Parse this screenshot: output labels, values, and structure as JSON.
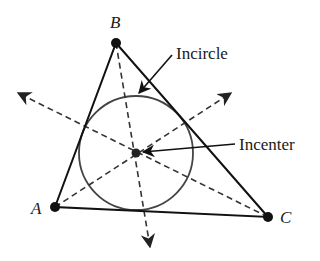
{
  "diagram": {
    "colors": {
      "stroke": "#111111",
      "circle": "#444444",
      "dashed": "#333333",
      "background": "#ffffff"
    },
    "vertices": [
      {
        "id": "A",
        "label": "A",
        "x": 55,
        "y": 207
      },
      {
        "id": "B",
        "label": "B",
        "x": 116,
        "y": 43
      },
      {
        "id": "C",
        "label": "C",
        "x": 268,
        "y": 217
      }
    ],
    "incenter": {
      "x": 136,
      "y": 153
    },
    "incircle": {
      "cx": 136,
      "cy": 153,
      "r": 57
    },
    "bisectors": [
      {
        "from": "B",
        "to_arrow": {
          "x": 150,
          "y": 247
        }
      },
      {
        "from": "A",
        "to_arrow": {
          "x": 231,
          "y": 93
        }
      },
      {
        "from": "C",
        "to_arrow": {
          "x": 18,
          "y": 93
        }
      }
    ],
    "callouts": [
      {
        "text": "Incircle",
        "label_x": 176,
        "label_y": 59,
        "arrow_from": {
          "x": 172,
          "y": 55
        },
        "arrow_to": {
          "x": 139,
          "y": 93
        }
      },
      {
        "text": "Incenter",
        "label_x": 239,
        "label_y": 150,
        "arrow_from": {
          "x": 235,
          "y": 144
        },
        "arrow_to": {
          "x": 142,
          "y": 152
        }
      }
    ]
  }
}
